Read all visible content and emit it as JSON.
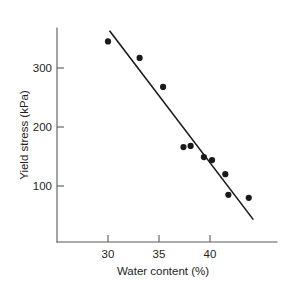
{
  "chart_data": {
    "type": "scatter",
    "title": "",
    "xlabel": "Water content (%)",
    "ylabel": "Yield stress (kPa)",
    "xlim": [
      26.6,
      44.8
    ],
    "ylim": [
      28,
      372
    ],
    "grid": false,
    "legend": "none",
    "xticks": [
      30,
      35,
      40
    ],
    "xtick_labels": [
      "30",
      "35",
      "40"
    ],
    "yticks": [
      100,
      200,
      300
    ],
    "ytick_labels": [
      "100",
      "200",
      "300"
    ],
    "x": [
      30.0,
      33.1,
      35.4,
      37.4,
      38.1,
      39.4,
      40.2,
      41.5,
      41.8,
      43.8
    ],
    "y": [
      345,
      317,
      268,
      166,
      168,
      149,
      144,
      120,
      85,
      80
    ],
    "points": [
      {
        "x": 30.0,
        "y": 345
      },
      {
        "x": 33.1,
        "y": 317
      },
      {
        "x": 35.4,
        "y": 268
      },
      {
        "x": 37.4,
        "y": 166
      },
      {
        "x": 38.1,
        "y": 168
      },
      {
        "x": 39.4,
        "y": 149
      },
      {
        "x": 40.2,
        "y": 144
      },
      {
        "x": 41.5,
        "y": 120
      },
      {
        "x": 41.8,
        "y": 85
      },
      {
        "x": 43.8,
        "y": 80
      }
    ],
    "series": [
      {
        "name": "Yield stress measurements",
        "marker": "filled-circle",
        "color": "#1a1a1a",
        "values": [
          345,
          317,
          268,
          166,
          168,
          149,
          144,
          120,
          85,
          80
        ]
      },
      {
        "name": "Linear trend line",
        "type": "line",
        "color": "#1a1a1a",
        "endpoints": [
          {
            "x": 30.15,
            "y": 363
          },
          {
            "x": 44.25,
            "y": 43
          }
        ]
      }
    ]
  },
  "axes": {
    "x_title": "Water content (%)",
    "y_title": "Yield stress (kPa)"
  }
}
